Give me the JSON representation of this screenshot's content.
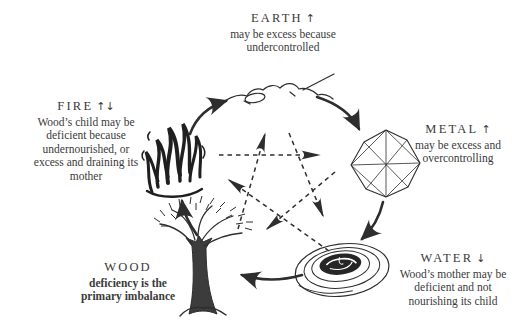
{
  "colors": {
    "ink": "#3a3a3a",
    "stroke": "#2e2e2e",
    "background": "#ffffff"
  },
  "nodes": {
    "earth": {
      "title": "EARTH",
      "arrows": "↑",
      "lines": [
        "may be excess because",
        "undercontrolled"
      ]
    },
    "metal": {
      "title": "METAL",
      "arrows": "↑",
      "lines": [
        "may be excess and",
        "overcontrolling"
      ]
    },
    "water": {
      "title": "WATER",
      "arrows": "↓",
      "lines": [
        "Wood’s mother may be",
        "deficient and not",
        "nourishing its child"
      ]
    },
    "wood": {
      "title": "WOOD",
      "emphasis": [
        "deficiency is the",
        "primary imbalance"
      ]
    },
    "fire": {
      "title": "FIRE",
      "arrows": "↑↓",
      "lines": [
        "Wood’s child may be",
        "deficient because",
        "undernourished, or",
        "excess and draining its",
        "mother"
      ]
    }
  },
  "icons": {
    "earth": "mountain-ridge-icon",
    "metal": "crystal-gem-icon",
    "water": "whirlpool-icon",
    "wood": "bare-tree-icon",
    "fire": "flames-icon"
  },
  "cycles": {
    "generating_solid_arrows": [
      "fire→earth",
      "earth→metal",
      "metal→water",
      "water→wood",
      "wood→fire"
    ],
    "controlling_dashed_arrows": [
      "wood→earth",
      "earth→water",
      "water→fire",
      "fire→metal",
      "metal→wood"
    ]
  }
}
